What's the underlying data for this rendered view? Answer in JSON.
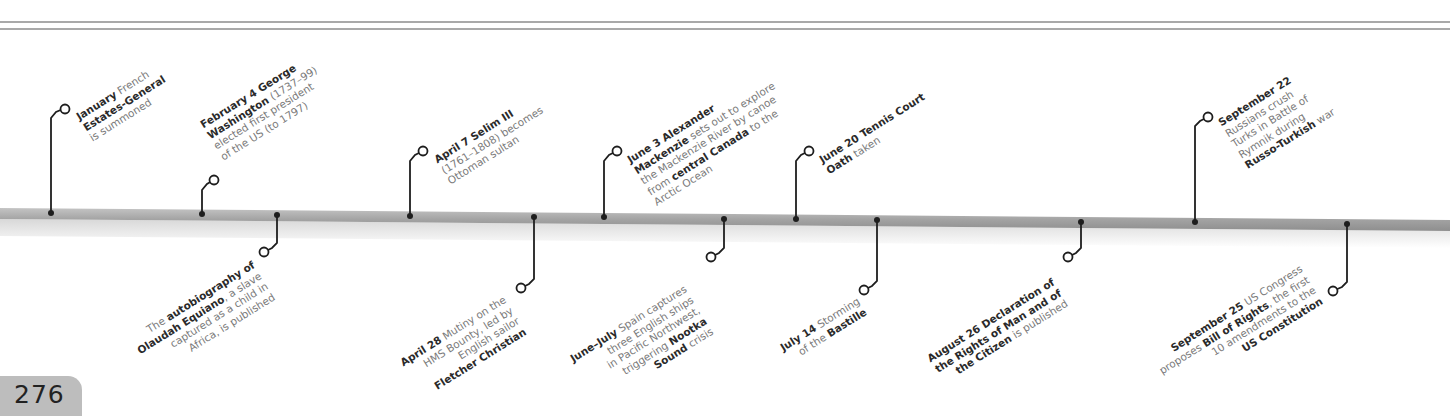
{
  "page": {
    "number": "276"
  },
  "timeline": {
    "bar_color": "#a6a6a6",
    "connector_color": "#1e1e1e",
    "events_above": [
      {
        "id": "jan",
        "date": "January",
        "parts": [
          [
            "b",
            "January"
          ],
          [
            "t",
            " French"
          ],
          [
            "br"
          ],
          [
            "b",
            "Estates-General"
          ],
          [
            "br"
          ],
          [
            "t",
            "is summoned"
          ]
        ]
      },
      {
        "id": "feb4",
        "date": "February 4",
        "parts": [
          [
            "b",
            "February 4 George"
          ],
          [
            "br"
          ],
          [
            "b",
            "Washington"
          ],
          [
            "t",
            " (1737–99)"
          ],
          [
            "br"
          ],
          [
            "t",
            "elected first president"
          ],
          [
            "br"
          ],
          [
            "t",
            "of the US (to 1797)"
          ]
        ]
      },
      {
        "id": "apr7",
        "date": "April 7",
        "parts": [
          [
            "b",
            "April 7 Selim III"
          ],
          [
            "br"
          ],
          [
            "t",
            "(1761–1808) becomes"
          ],
          [
            "br"
          ],
          [
            "t",
            "Ottoman sultan"
          ]
        ]
      },
      {
        "id": "jun3",
        "date": "June 3",
        "parts": [
          [
            "b",
            "June 3 Alexander"
          ],
          [
            "br"
          ],
          [
            "b",
            "Mackenzie"
          ],
          [
            "t",
            " sets out to explore"
          ],
          [
            "br"
          ],
          [
            "t",
            "the Mackenzie River by canoe"
          ],
          [
            "br"
          ],
          [
            "t",
            "from "
          ],
          [
            "b",
            "central Canada"
          ],
          [
            "t",
            " to the"
          ],
          [
            "br"
          ],
          [
            "t",
            "Arctic Ocean"
          ]
        ]
      },
      {
        "id": "jun20",
        "date": "June 20",
        "parts": [
          [
            "b",
            "June 20 Tennis Court"
          ],
          [
            "br"
          ],
          [
            "b",
            "Oath"
          ],
          [
            "t",
            " taken"
          ]
        ]
      },
      {
        "id": "sep22",
        "date": "September 22",
        "parts": [
          [
            "b",
            "September 22"
          ],
          [
            "br"
          ],
          [
            "t",
            "Russians crush"
          ],
          [
            "br"
          ],
          [
            "t",
            "Turks in Battle of"
          ],
          [
            "br"
          ],
          [
            "t",
            "Rymnik during"
          ],
          [
            "br"
          ],
          [
            "b",
            "Russo-Turkish"
          ],
          [
            "t",
            " war"
          ]
        ]
      }
    ],
    "events_below": [
      {
        "id": "equiano",
        "date": "",
        "parts": [
          [
            "t",
            "The "
          ],
          [
            "b",
            "autobiography of"
          ],
          [
            "br"
          ],
          [
            "b",
            "Olaudah Equiano"
          ],
          [
            "t",
            ", a slave"
          ],
          [
            "br"
          ],
          [
            "t",
            "captured as a child in"
          ],
          [
            "br"
          ],
          [
            "t",
            "Africa, is published"
          ]
        ]
      },
      {
        "id": "apr28",
        "date": "April 28",
        "parts": [
          [
            "b",
            "April 28"
          ],
          [
            "t",
            " Mutiny on the"
          ],
          [
            "br"
          ],
          [
            "t",
            "HMS Bounty, led by"
          ],
          [
            "br"
          ],
          [
            "t",
            "English sailor"
          ],
          [
            "br"
          ],
          [
            "b",
            "Fletcher Christian"
          ]
        ]
      },
      {
        "id": "junjul",
        "date": "June–July",
        "parts": [
          [
            "b",
            "June–July"
          ],
          [
            "t",
            " Spain captures"
          ],
          [
            "br"
          ],
          [
            "t",
            "three English ships"
          ],
          [
            "br"
          ],
          [
            "t",
            "in Pacific Northwest,"
          ],
          [
            "br"
          ],
          [
            "t",
            "triggering "
          ],
          [
            "b",
            "Nootka"
          ],
          [
            "br"
          ],
          [
            "b",
            "Sound"
          ],
          [
            "t",
            " crisis"
          ]
        ]
      },
      {
        "id": "jul14",
        "date": "July 14",
        "parts": [
          [
            "b",
            "July 14"
          ],
          [
            "t",
            " Storming"
          ],
          [
            "br"
          ],
          [
            "t",
            "of the "
          ],
          [
            "b",
            "Bastille"
          ]
        ]
      },
      {
        "id": "aug26",
        "date": "August 26",
        "parts": [
          [
            "b",
            "August 26 Declaration of"
          ],
          [
            "br"
          ],
          [
            "b",
            "the Rights of Man and of"
          ],
          [
            "br"
          ],
          [
            "b",
            "the Citizen"
          ],
          [
            "t",
            " is published"
          ]
        ]
      },
      {
        "id": "sep25",
        "date": "September 25",
        "parts": [
          [
            "b",
            "September 25"
          ],
          [
            "t",
            " US Congress"
          ],
          [
            "br"
          ],
          [
            "t",
            "proposes "
          ],
          [
            "b",
            "Bill of Rights"
          ],
          [
            "t",
            ", the first"
          ],
          [
            "br"
          ],
          [
            "t",
            "10 amendments to the"
          ],
          [
            "br"
          ],
          [
            "b",
            "US Constitution"
          ]
        ]
      }
    ]
  }
}
